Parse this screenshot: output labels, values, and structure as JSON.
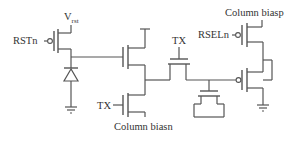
{
  "diagram": {
    "type": "circuit-schematic",
    "labels": {
      "vrst_main": "V",
      "vrst_sub": "rst",
      "rstn": "RSTn",
      "tx_left": "TX",
      "tx_top": "TX",
      "column_biasn": "Column biasn",
      "column_biasp": "Column biasp",
      "rseln": "RSELn"
    },
    "components": [
      {
        "id": "M_rst",
        "kind": "pmos",
        "gate": "RSTn",
        "source": "Vrst"
      },
      {
        "id": "D_photo",
        "kind": "photodiode",
        "to": "ground"
      },
      {
        "id": "M_sf",
        "kind": "nmos",
        "gate": "photodiode-node"
      },
      {
        "id": "M_bias_n",
        "kind": "nmos",
        "gate": "TX",
        "source": "Column biasn"
      },
      {
        "id": "M_tx",
        "kind": "nmos",
        "gate": "TX"
      },
      {
        "id": "C_store",
        "kind": "mos-capacitor"
      },
      {
        "id": "M_rsel",
        "kind": "pmos",
        "gate": "RSELn",
        "source": "Column biasp"
      },
      {
        "id": "M_out",
        "kind": "pmos",
        "gate": "storage-node",
        "drain": "ground"
      }
    ],
    "colors": {
      "line": "#555555",
      "text": "#333333",
      "background": "#ffffff"
    }
  }
}
